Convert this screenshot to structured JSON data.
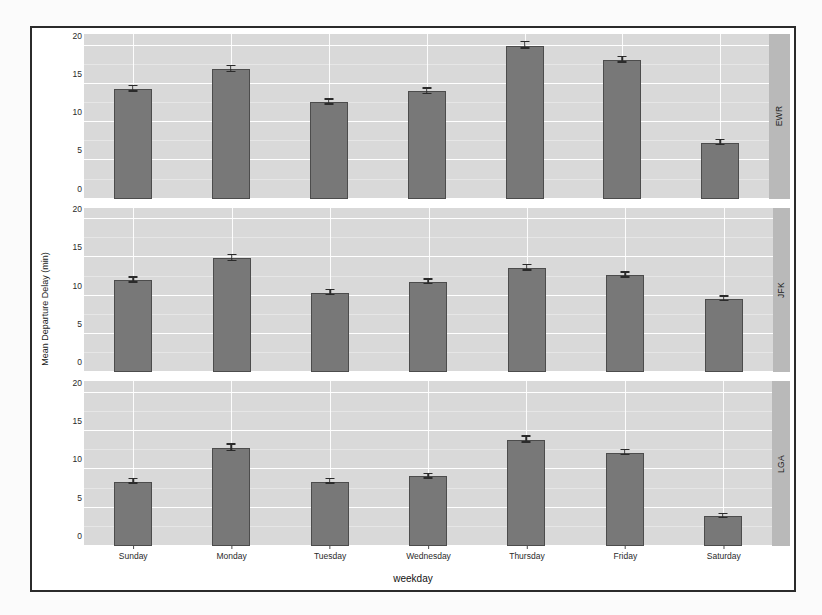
{
  "chart_data": {
    "type": "bar",
    "title": "",
    "xlabel": "weekday",
    "ylabel": "Mean Departure Delay (min)",
    "categories": [
      "Sunday",
      "Monday",
      "Tuesday",
      "Wednesday",
      "Thursday",
      "Friday",
      "Saturday"
    ],
    "ylim": [
      0,
      21.5
    ],
    "yticks": [
      0,
      5,
      10,
      15,
      20
    ],
    "ytick_labels": [
      "0",
      "5",
      "10",
      "15",
      "20"
    ],
    "grid": true,
    "legend": "none",
    "facet_variable": "origin",
    "facet_position": "right",
    "error_bars": true,
    "panels": [
      {
        "label": "EWR",
        "values": [
          14.3,
          16.9,
          12.6,
          14.0,
          20.0,
          18.1,
          7.3
        ],
        "errors": [
          0.35,
          0.38,
          0.33,
          0.35,
          0.45,
          0.35,
          0.3
        ]
      },
      {
        "label": "JFK",
        "values": [
          12.0,
          14.9,
          10.4,
          11.8,
          13.6,
          12.7,
          9.6
        ],
        "errors": [
          0.33,
          0.38,
          0.3,
          0.32,
          0.36,
          0.33,
          0.3
        ]
      },
      {
        "label": "LGA",
        "values": [
          8.4,
          12.8,
          8.4,
          9.1,
          13.9,
          12.2,
          3.9
        ],
        "errors": [
          0.3,
          0.42,
          0.3,
          0.3,
          0.4,
          0.33,
          0.26
        ]
      }
    ],
    "colors": {
      "bar_fill": "#787878",
      "bar_border": "#4c4c4c",
      "panel_background": "#d9d9d9",
      "gridline": "#ffffff",
      "strip_background": "#b9b9b9",
      "error_bar": "#2a2a2a",
      "frame": "#2b2b2b"
    }
  }
}
